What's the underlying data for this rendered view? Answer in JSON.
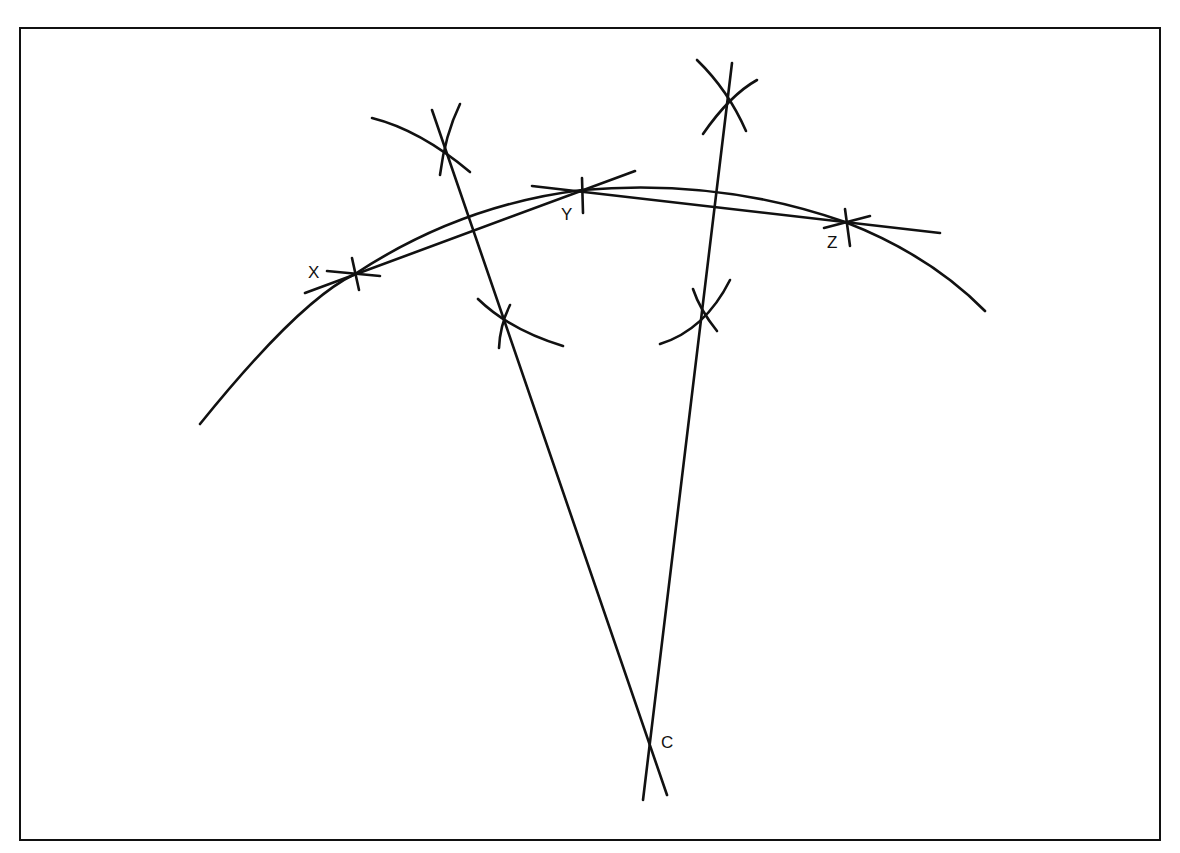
{
  "diagram": {
    "labels": {
      "x": "X",
      "y": "Y",
      "z": "Z",
      "c": "C"
    },
    "points": {
      "X": [
        355,
        274
      ],
      "Y": [
        582,
        190
      ],
      "Z": [
        845,
        222
      ],
      "C": [
        650,
        742
      ]
    },
    "colors": {
      "stroke": "#111111",
      "background": "#ffffff",
      "frame": "#111111"
    }
  }
}
